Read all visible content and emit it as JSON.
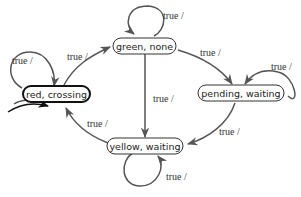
{
  "diagram": {
    "type": "state-machine",
    "nodes": [
      {
        "id": "red",
        "label": "red, crossing",
        "initial": true
      },
      {
        "id": "green",
        "label": "green, none",
        "initial": false
      },
      {
        "id": "pending",
        "label": "pending, waiting",
        "initial": false
      },
      {
        "id": "yellow",
        "label": "yellow, waiting",
        "initial": false
      }
    ],
    "edges": [
      {
        "from": "red",
        "to": "red",
        "label": "true /"
      },
      {
        "from": "red",
        "to": "green",
        "label": "true /"
      },
      {
        "from": "green",
        "to": "green",
        "label": "true /"
      },
      {
        "from": "green",
        "to": "pending",
        "label": "true /"
      },
      {
        "from": "green",
        "to": "yellow",
        "label": "true /"
      },
      {
        "from": "pending",
        "to": "pending",
        "label": "true /"
      },
      {
        "from": "pending",
        "to": "yellow",
        "label": "true /"
      },
      {
        "from": "yellow",
        "to": "yellow",
        "label": "true /"
      },
      {
        "from": "yellow",
        "to": "red",
        "label": "true /"
      }
    ],
    "colors": {
      "edge": "#555555",
      "node_border": "#333333",
      "initial_border": "#111111"
    }
  }
}
